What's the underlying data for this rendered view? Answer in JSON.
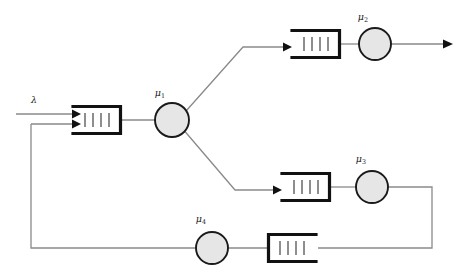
{
  "diagram": {
    "type": "queueing-network",
    "background_color": "#ffffff",
    "edge_color": "#8a8a8a",
    "queue_color": "#111111",
    "server_fill": "#e6e6e6",
    "server_stroke": "#1a1a1a",
    "canvas": {
      "width": 461,
      "height": 278
    }
  },
  "labels": {
    "arrival": {
      "symbol": "λ",
      "subscript": "",
      "x": 34,
      "y": 101
    },
    "mu1": {
      "symbol": "μ",
      "subscript": "1",
      "x": 160,
      "y": 95
    },
    "mu2": {
      "symbol": "μ",
      "subscript": "2",
      "x": 363,
      "y": 19
    },
    "mu3": {
      "symbol": "μ",
      "subscript": "3",
      "x": 360,
      "y": 160
    },
    "mu4": {
      "symbol": "μ",
      "subscript": "4",
      "x": 200,
      "y": 220
    }
  },
  "queues": [
    {
      "name": "queue-1",
      "x": 73,
      "y": 106,
      "width": 48,
      "height": 27,
      "ticks": 4,
      "orientation": "left-open"
    },
    {
      "name": "queue-2",
      "x": 292,
      "y": 30,
      "width": 48,
      "height": 27,
      "ticks": 4,
      "orientation": "left-open"
    },
    {
      "name": "queue-3",
      "x": 282,
      "y": 174,
      "width": 48,
      "height": 27,
      "ticks": 4,
      "orientation": "left-open"
    },
    {
      "name": "queue-4",
      "x": 268,
      "y": 234,
      "width": 48,
      "height": 27,
      "ticks": 4,
      "orientation": "right-open"
    }
  ],
  "servers": [
    {
      "name": "server-mu1",
      "cx": 172,
      "cy": 120,
      "r": 17
    },
    {
      "name": "server-mu2",
      "cx": 375,
      "cy": 44,
      "r": 16
    },
    {
      "name": "server-mu3",
      "cx": 372,
      "cy": 187,
      "r": 16
    },
    {
      "name": "server-mu4",
      "cx": 212,
      "cy": 248,
      "r": 16
    }
  ],
  "edges": [
    {
      "name": "arrival-edge",
      "from": "external",
      "to": "queue-1",
      "path": "M 16 114 L 76 114",
      "arrow": true
    },
    {
      "name": "feedback-entry-edge",
      "from": "feedback-loop",
      "to": "queue-1",
      "path": "M 31 124 L 76 124",
      "arrow": true
    },
    {
      "name": "queue1-to-server1-edge",
      "from": "queue-1",
      "to": "server-mu1",
      "path": "M 121 120 L 155 120",
      "arrow": false
    },
    {
      "name": "server1-to-queue2-edge",
      "from": "server-mu1",
      "to": "queue-2",
      "path": "M 186 111 L 243 47 L 292 47",
      "arrow": true
    },
    {
      "name": "server1-to-queue3-edge",
      "from": "server-mu1",
      "to": "queue-3",
      "path": "M 185 131 L 235 190 L 282 190",
      "arrow": true
    },
    {
      "name": "queue2-to-server2-edge",
      "from": "queue-2",
      "to": "server-mu2",
      "path": "M 340 44 L 359 44",
      "arrow": false
    },
    {
      "name": "server2-exit-edge",
      "from": "server-mu2",
      "to": "external",
      "path": "M 391 44 L 452 44",
      "arrow": true
    },
    {
      "name": "queue3-to-server3-edge",
      "from": "queue-3",
      "to": "server-mu3",
      "path": "M 330 187 L 356 187",
      "arrow": false
    },
    {
      "name": "server3-to-queue4-edge",
      "from": "server-mu3",
      "to": "queue-4",
      "path": "M 388 187 L 432 187 L 432 248 L 316 248",
      "arrow": false
    },
    {
      "name": "queue4-to-server4-edge",
      "from": "queue-4",
      "to": "server-mu4",
      "path": "M 268 248 L 228 248",
      "arrow": false
    },
    {
      "name": "server4-feedback-edge",
      "from": "server-mu4",
      "to": "feedback-loop",
      "path": "M 196 248 L 31 248 L 31 124",
      "arrow": false
    }
  ]
}
